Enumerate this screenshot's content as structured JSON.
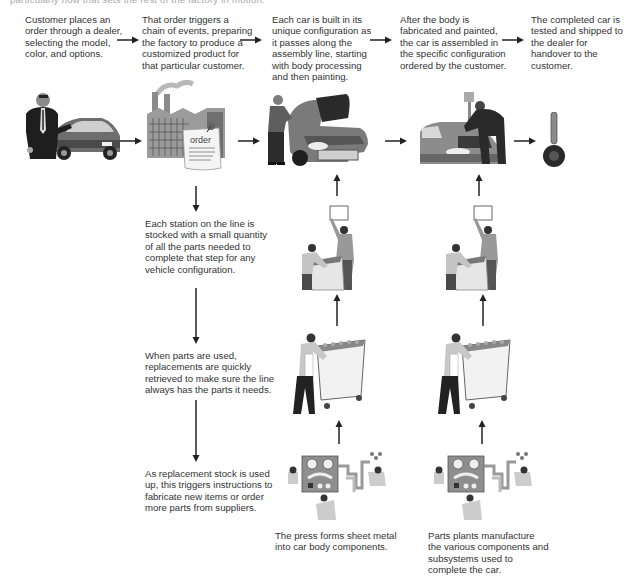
{
  "cropped_header_text": "particularly how that sets the rest of the factory in motion.",
  "top_row": [
    {
      "id": "customer",
      "text": "Customer places an order through a dealer, selecting the model, color, and options.",
      "illustration": "dealer-with-car"
    },
    {
      "id": "order",
      "text": "That order triggers a chain of events, preparing the factory to produce a customized product for that particular customer.",
      "illustration": "factory-with-order",
      "order_label": "order"
    },
    {
      "id": "body",
      "text": "Each car is built in its unique configuration as it passes along the assembly line, starting with body processing and then painting.",
      "illustration": "worker-at-car-body"
    },
    {
      "id": "assembly",
      "text": "After the body is fabricated and painted, the car is assembled in the specific configuration ordered by the customer.",
      "illustration": "worker-assembling-car"
    },
    {
      "id": "handover",
      "text": "The completed car is tested and shipped to the dealer for handover to the customer.",
      "illustration": "car-key"
    }
  ],
  "left_column": [
    {
      "id": "station",
      "text": "Each station on the line is stocked with a small quantity of all the parts needed to complete that step for any vehicle configuration."
    },
    {
      "id": "replacement",
      "text": "When parts are used, replacements are quickly retrieved to make sure the line always has the parts it needs."
    },
    {
      "id": "reorder",
      "text": "As replacement stock is used up, this triggers instructions to fabricate new items or order more parts from suppliers."
    }
  ],
  "bottom_row": [
    {
      "id": "press",
      "text": "The press forms sheet metal into car body components.",
      "illustration": "press-machine"
    },
    {
      "id": "parts-plant",
      "text": "Parts plants manufacture the various components and subsystems used to complete the car.",
      "illustration": "parts-machine"
    }
  ],
  "columns": [
    {
      "id": "press-column",
      "stages": [
        "workers-at-station",
        "worker-with-cart",
        "press-machine"
      ]
    },
    {
      "id": "parts-column",
      "stages": [
        "workers-at-station",
        "worker-with-cart",
        "parts-machine"
      ]
    }
  ]
}
